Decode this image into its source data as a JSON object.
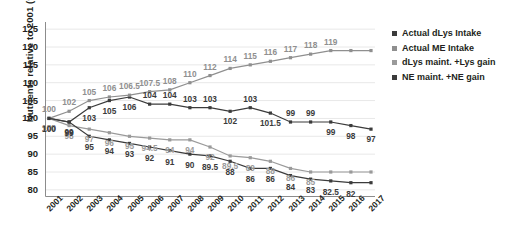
{
  "chart_data": {
    "type": "line",
    "title": "",
    "xlabel": "",
    "ylabel": "Nutrients relative to 2001 (%)",
    "ylim": [
      78,
      127
    ],
    "yticks": [
      80,
      85,
      90,
      95,
      100,
      105,
      110,
      115,
      120,
      125
    ],
    "grid": true,
    "legend_position": "right",
    "categories": [
      "2001",
      "2002",
      "2003",
      "2004",
      "2005",
      "2006",
      "2007",
      "2008",
      "2009",
      "2010",
      "2011",
      "2012",
      "2013",
      "2014",
      "2015",
      "2016",
      "2017"
    ],
    "series": [
      {
        "name": "Actual dLys Intake",
        "color": "#3b3b3b",
        "values": [
          100,
          99,
          103,
          105,
          106,
          104,
          104,
          103,
          103,
          102,
          103,
          101.5,
          99,
          99,
          99,
          98,
          97
        ],
        "labels": [
          "100",
          "99",
          "103",
          "105",
          "106",
          "104",
          "104",
          "103",
          "103",
          "102",
          "103",
          "101.5",
          "99",
          "99",
          "99",
          "98",
          "97"
        ]
      },
      {
        "name": "Actual ME Intake",
        "color": "#8f8f8f",
        "values": [
          100,
          102,
          105,
          106,
          106.5,
          107.5,
          108,
          110,
          112,
          114,
          115,
          116,
          117,
          118,
          119,
          119,
          119
        ],
        "labels": [
          "100",
          "102",
          "105",
          "106",
          "106.5",
          "107.5",
          "108",
          "110",
          "112",
          "114",
          "115",
          "116",
          "117",
          "118",
          "119",
          "",
          ""
        ]
      },
      {
        "name": "dLys maint. +Lys gain",
        "color": "#9a9a9a",
        "values": [
          100,
          98,
          97,
          96,
          95,
          94.5,
          94,
          94,
          92,
          89.5,
          89,
          88,
          86,
          85,
          85,
          85,
          85
        ],
        "labels": [
          "100",
          "98",
          "97",
          "96",
          "95",
          "94.5",
          "94",
          "94",
          "92",
          "89.5",
          "89",
          "88",
          "86",
          "85",
          "",
          "",
          ""
        ]
      },
      {
        "name": "NE maint. +NE gain",
        "color": "#3b3b3b",
        "values": [
          100,
          99,
          95,
          94,
          93,
          92,
          91,
          90,
          89.5,
          88,
          86,
          86,
          84,
          83,
          82.5,
          82,
          82
        ],
        "labels": [
          "100",
          "99",
          "95",
          "94",
          "93",
          "92",
          "91",
          "90",
          "89.5",
          "88",
          "86",
          "86",
          "84",
          "83",
          "82.5",
          "82",
          ""
        ]
      }
    ]
  },
  "legend": {
    "items": [
      {
        "label": "Actual dLys Intake",
        "color": "#3b3b3b"
      },
      {
        "label": "Actual ME Intake",
        "color": "#8f8f8f"
      },
      {
        "label": "dLys maint. +Lys gain",
        "color": "#9a9a9a"
      },
      {
        "label": "NE maint. +NE gain",
        "color": "#3b3b3b"
      }
    ]
  }
}
